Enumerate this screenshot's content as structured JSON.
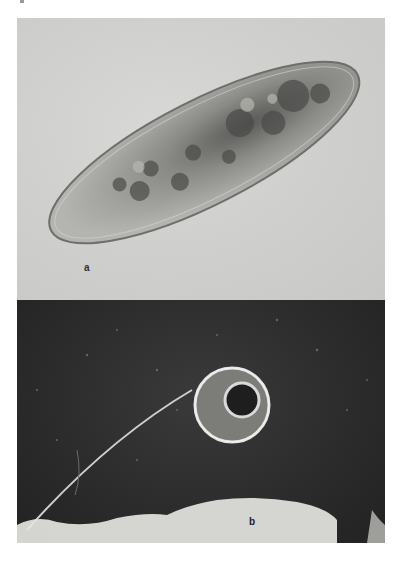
{
  "figure": {
    "panels": [
      {
        "id": "a",
        "label": "a",
        "subject": "paramecium-brightfield"
      },
      {
        "id": "b",
        "label": "b",
        "subject": "stalked-ciliate-darkfield"
      }
    ]
  },
  "colors": {
    "panel_a_background": "#cfcfcd",
    "panel_b_background": "#2b2b2b",
    "label_color": "#222222"
  }
}
